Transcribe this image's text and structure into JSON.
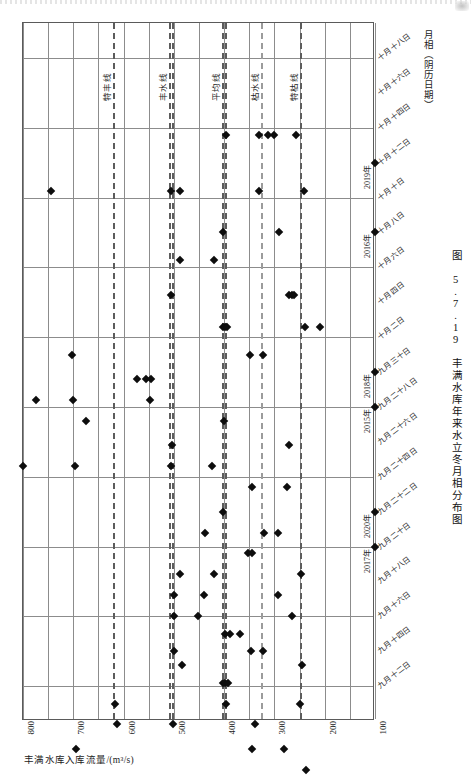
{
  "figure": {
    "caption": "图 5.7.19  丰满水库年来水立冬月相分布图"
  },
  "axes": {
    "flow_axis_title": "丰满水库入库流量/(m³/s)",
    "date_axis_title": "月相（阴历日期）"
  },
  "chart_data": {
    "type": "scatter",
    "title": "图 5.7.19  丰满水库年来水立冬月相分布图",
    "xlabel": "丰满水库入库流量/(m³/s)",
    "ylabel": "月相（阴历日期）",
    "grid": true,
    "legend": "none",
    "orientation": "rotated-90",
    "xlim": [
      800,
      100
    ],
    "x_ticks": [
      "800",
      "700",
      "600",
      "500",
      "400",
      "300",
      "200",
      "100"
    ],
    "x_tick_values": [
      800,
      700,
      600,
      500,
      400,
      300,
      200,
      100
    ],
    "y_ticks": [
      "十月十八日",
      "十月十六日",
      "十月十四日",
      "十月十二日",
      "十月十日",
      "十月八日",
      "十月六日",
      "十月四日",
      "十月二日",
      "九月三十日",
      "九月二十八日",
      "九月二十六日",
      "九月二十四日",
      "九月二十二日",
      "九月二十日",
      "九月十八日",
      "九月十六日",
      "九月十四日",
      "九月十二日"
    ],
    "reference_lines": [
      {
        "label": "特丰线",
        "value": 620,
        "style": "dashed"
      },
      {
        "label": "丰水线",
        "value": 508,
        "style": "dashed-double"
      },
      {
        "label": "平均线",
        "value": 403,
        "style": "dashed-double"
      },
      {
        "label": "枯水线",
        "value": 325,
        "style": "dashed-light"
      },
      {
        "label": "特枯线",
        "value": 247,
        "style": "dashed"
      }
    ],
    "year_markers": [
      {
        "year": "2019年",
        "date": "十月十二日"
      },
      {
        "year": "2016年",
        "date": "十月八日"
      },
      {
        "year": "2018年",
        "date": "九月三十日"
      },
      {
        "year": "2015年",
        "date": "九月二十八日"
      },
      {
        "year": "2020年",
        "date": "九月二十二日"
      },
      {
        "year": "2017年",
        "date": "九月二十日"
      }
    ],
    "points": [
      {
        "x": 745,
        "y": 14.2
      },
      {
        "x": 505,
        "y": 14.2
      },
      {
        "x": 487,
        "y": 14.2
      },
      {
        "x": 330,
        "y": 14.2
      },
      {
        "x": 242,
        "y": 14.2
      },
      {
        "x": 396,
        "y": 15.8
      },
      {
        "x": 330,
        "y": 15.8
      },
      {
        "x": 312,
        "y": 15.8
      },
      {
        "x": 300,
        "y": 15.8
      },
      {
        "x": 258,
        "y": 15.8
      },
      {
        "x": 402,
        "y": 13.0
      },
      {
        "x": 290,
        "y": 13.0
      },
      {
        "x": 487,
        "y": 12.2
      },
      {
        "x": 420,
        "y": 12.2
      },
      {
        "x": 505,
        "y": 11.2
      },
      {
        "x": 272,
        "y": 11.2
      },
      {
        "x": 266,
        "y": 11.2
      },
      {
        "x": 262,
        "y": 11.2
      },
      {
        "x": 402,
        "y": 10.3
      },
      {
        "x": 398,
        "y": 10.3
      },
      {
        "x": 394,
        "y": 10.3
      },
      {
        "x": 240,
        "y": 10.3
      },
      {
        "x": 210,
        "y": 10.3
      },
      {
        "x": 703,
        "y": 9.5
      },
      {
        "x": 348,
        "y": 9.5
      },
      {
        "x": 322,
        "y": 9.5
      },
      {
        "x": 573,
        "y": 8.8
      },
      {
        "x": 555,
        "y": 8.8
      },
      {
        "x": 545,
        "y": 8.8
      },
      {
        "x": 775,
        "y": 8.2
      },
      {
        "x": 700,
        "y": 8.2
      },
      {
        "x": 548,
        "y": 8.2
      },
      {
        "x": 675,
        "y": 7.6
      },
      {
        "x": 400,
        "y": 7.6
      },
      {
        "x": 503,
        "y": 6.9
      },
      {
        "x": 272,
        "y": 6.9
      },
      {
        "x": 800,
        "y": 6.3
      },
      {
        "x": 697,
        "y": 6.3
      },
      {
        "x": 506,
        "y": 6.3
      },
      {
        "x": 424,
        "y": 6.3
      },
      {
        "x": 345,
        "y": 5.7
      },
      {
        "x": 275,
        "y": 5.7
      },
      {
        "x": 402,
        "y": 5.0
      },
      {
        "x": 438,
        "y": 4.4
      },
      {
        "x": 320,
        "y": 4.4
      },
      {
        "x": 292,
        "y": 4.4
      },
      {
        "x": 352,
        "y": 3.8
      },
      {
        "x": 344,
        "y": 3.8
      },
      {
        "x": 487,
        "y": 3.2
      },
      {
        "x": 420,
        "y": 3.2
      },
      {
        "x": 248,
        "y": 3.2
      },
      {
        "x": 500,
        "y": 2.6
      },
      {
        "x": 440,
        "y": 2.6
      },
      {
        "x": 292,
        "y": 2.6
      },
      {
        "x": 500,
        "y": 2.0
      },
      {
        "x": 452,
        "y": 2.0
      },
      {
        "x": 265,
        "y": 2.0
      },
      {
        "x": 398,
        "y": 1.5
      },
      {
        "x": 388,
        "y": 1.5
      },
      {
        "x": 368,
        "y": 1.5
      },
      {
        "x": 500,
        "y": 1.0
      },
      {
        "x": 347,
        "y": 1.0
      },
      {
        "x": 322,
        "y": 1.0
      },
      {
        "x": 484,
        "y": 0.6
      },
      {
        "x": 246,
        "y": 0.6
      },
      {
        "x": 402,
        "y": 0.1
      },
      {
        "x": 398,
        "y": 0.1
      },
      {
        "x": 393,
        "y": 0.1
      },
      {
        "x": 618,
        "y": -0.5
      },
      {
        "x": 396,
        "y": -0.5
      },
      {
        "x": 250,
        "y": -0.5
      },
      {
        "x": 613,
        "y": -1.1
      },
      {
        "x": 502,
        "y": -1.1
      },
      {
        "x": 338,
        "y": -1.1
      },
      {
        "x": 695,
        "y": -1.8
      },
      {
        "x": 345,
        "y": -1.8
      },
      {
        "x": 281,
        "y": -1.8
      },
      {
        "x": 238,
        "y": -2.4
      },
      {
        "x": 318,
        "y": -2.9
      },
      {
        "x": 281,
        "y": -2.9
      },
      {
        "x": 616,
        "y": -2.9
      },
      {
        "x": 610,
        "y": -2.9
      },
      {
        "x": 604,
        "y": -2.9
      },
      {
        "x": 730,
        "y": -3.5
      },
      {
        "x": 238,
        "y": -3.5
      },
      {
        "x": 267,
        "y": -4.1
      }
    ]
  }
}
